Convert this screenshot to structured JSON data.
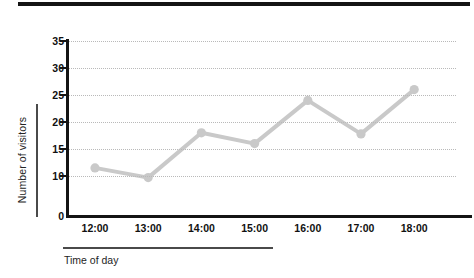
{
  "figure": {
    "top_rule_present": true,
    "background_color": "#ffffff"
  },
  "axes": {
    "y_caption": "Number of visitors",
    "x_caption": "Time of day",
    "y_tick_labels": [
      "35",
      "30",
      "25",
      "20",
      "15",
      "10",
      "0"
    ],
    "x_tick_labels": [
      "12:00",
      "13:00",
      "14:00",
      "15:00",
      "16:00",
      "17:00",
      "18:00"
    ]
  },
  "chart_data": {
    "type": "line",
    "title": "",
    "xlabel": "Time of day",
    "ylabel": "Number of visitors",
    "categories": [
      "12:00",
      "13:00",
      "14:00",
      "15:00",
      "16:00",
      "17:00",
      "18:00"
    ],
    "values": [
      11.5,
      9.7,
      18,
      16,
      24,
      17.8,
      26
    ],
    "series": [
      {
        "name": "Number of visitors",
        "values": [
          11.5,
          9.7,
          18,
          16,
          24,
          17.8,
          26
        ],
        "color": "#c9c9c9",
        "marker": "circle",
        "line_width": 4
      }
    ],
    "ylim": [
      0,
      35
    ],
    "y_ticks": [
      0,
      10,
      15,
      20,
      25,
      30,
      35
    ],
    "y_axis_break_between": [
      0,
      10
    ],
    "grid": true,
    "grid_style": "dotted",
    "grid_color": "#b9b9b9",
    "legend": false,
    "legend_position": "none",
    "axis_color": "#141414"
  },
  "colors": {
    "series": "#c9c9c9",
    "axis": "#141414",
    "grid": "#b9b9b9",
    "text": "#111111",
    "caption_rule": "#4a4a4a"
  }
}
